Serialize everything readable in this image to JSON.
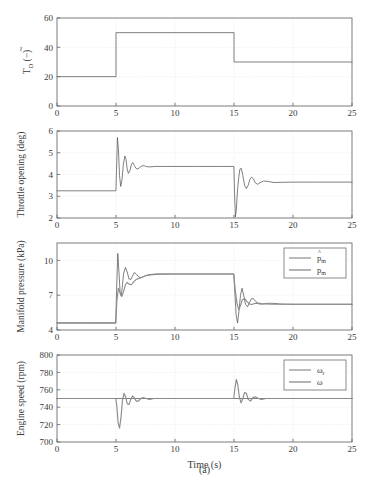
{
  "figure": {
    "caption": "(a)",
    "xlabel": "Time (s)",
    "line_color_estimate": "#555555",
    "line_color_actual": "#8c8c8c",
    "axis_color": "#6e6e6e",
    "grid_color": "#dcdcdc"
  },
  "chart_data": [
    {
      "type": "line",
      "title": "",
      "ylabel": "T̃_D (−)",
      "ylabel_parts": {
        "base": "T",
        "accent": "~",
        "sub": "D",
        "unit": "(−)"
      },
      "xlabel": "",
      "xlim": [
        0,
        25
      ],
      "ylim": [
        0,
        60
      ],
      "xticks": [
        0,
        5,
        10,
        15,
        20,
        25
      ],
      "yticks": [
        0,
        20,
        40,
        60
      ],
      "grid": true,
      "legend": null,
      "series": [
        {
          "name": "T_D",
          "style": "solid",
          "x": [
            0,
            5,
            5,
            15,
            15,
            25
          ],
          "values": [
            20,
            20,
            50,
            50,
            30,
            30
          ]
        }
      ],
      "annotations": [
        "step up from 20 to 50 at t=5 s",
        "step down from 50 to 30 at t=15 s"
      ]
    },
    {
      "type": "line",
      "title": "",
      "ylabel": "Throttle opening (deg)",
      "xlabel": "",
      "xlim": [
        0,
        25
      ],
      "ylim": [
        2,
        6
      ],
      "xticks": [
        0,
        5,
        10,
        15,
        20,
        25
      ],
      "yticks": [
        2,
        3,
        4,
        5,
        6
      ],
      "grid": true,
      "legend": null,
      "series": [
        {
          "name": "throttle",
          "style": "solid",
          "x": [
            0,
            1,
            2,
            3,
            4,
            4.99,
            5.05,
            5.12,
            5.2,
            5.3,
            5.4,
            5.5,
            5.62,
            5.75,
            5.85,
            5.95,
            6.05,
            6.18,
            6.3,
            6.42,
            6.55,
            6.7,
            6.85,
            7.0,
            7.2,
            7.4,
            7.6,
            7.9,
            8.3,
            9,
            10,
            12,
            14,
            14.99,
            15.05,
            15.12,
            15.2,
            15.3,
            15.4,
            15.5,
            15.62,
            15.75,
            15.9,
            16.05,
            16.2,
            16.35,
            16.5,
            16.65,
            16.8,
            17.0,
            17.2,
            17.5,
            17.9,
            18.4,
            19,
            20,
            22,
            25
          ],
          "values": [
            3.25,
            3.25,
            3.25,
            3.25,
            3.25,
            3.25,
            4.3,
            5.7,
            5.2,
            3.95,
            3.45,
            3.72,
            4.45,
            4.85,
            4.7,
            4.25,
            4.05,
            4.18,
            4.45,
            4.55,
            4.42,
            4.28,
            4.25,
            4.32,
            4.4,
            4.4,
            4.36,
            4.35,
            4.37,
            4.37,
            4.37,
            4.37,
            4.37,
            4.37,
            3.1,
            2.05,
            2.4,
            3.3,
            3.85,
            4.25,
            4.28,
            3.95,
            3.5,
            3.35,
            3.5,
            3.78,
            3.88,
            3.8,
            3.62,
            3.55,
            3.62,
            3.7,
            3.68,
            3.63,
            3.64,
            3.65,
            3.65,
            3.65
          ]
        }
      ],
      "annotations": [
        "baseline 3.25 deg",
        "overshoot to 5.7 deg at t=5 s",
        "settles near 4.37 deg",
        "undershoot to 2.05 deg at t=15 s",
        "settles near 3.65 deg"
      ]
    },
    {
      "type": "line",
      "title": "",
      "ylabel": "Manifold pressure (kPa)",
      "xlabel": "",
      "xlim": [
        0,
        25
      ],
      "ylim": [
        4,
        11.5
      ],
      "xticks": [
        0,
        5,
        10,
        15,
        20,
        25
      ],
      "yticks": [
        4,
        7,
        10
      ],
      "grid": true,
      "legend": {
        "position": "top-right",
        "entries": [
          "p̂_m",
          "p_m"
        ]
      },
      "series": [
        {
          "name": "p_hat_m",
          "label_parts": {
            "base": "p",
            "accent": "^",
            "sub": "m"
          },
          "style": "solid",
          "x": [
            0,
            1,
            2,
            3,
            4,
            4.98,
            5.05,
            5.15,
            5.25,
            5.35,
            5.45,
            5.55,
            5.65,
            5.8,
            5.95,
            6.1,
            6.25,
            6.4,
            6.55,
            6.7,
            6.9,
            7.1,
            7.35,
            7.6,
            7.9,
            8.3,
            8.8,
            9.5,
            10.5,
            12,
            14,
            14.98,
            15.08,
            15.18,
            15.3,
            15.42,
            15.55,
            15.68,
            15.82,
            15.98,
            16.15,
            16.3,
            16.48,
            16.65,
            16.85,
            17.1,
            17.4,
            17.8,
            18.3,
            19,
            20,
            22,
            25
          ],
          "values": [
            4.6,
            4.6,
            4.6,
            4.6,
            4.6,
            4.6,
            7.4,
            10.6,
            9.0,
            7.2,
            6.9,
            7.9,
            8.9,
            9.4,
            9.0,
            8.4,
            8.35,
            8.65,
            8.95,
            8.85,
            8.6,
            8.5,
            8.6,
            8.72,
            8.78,
            8.82,
            8.83,
            8.83,
            8.83,
            8.83,
            8.83,
            8.83,
            7.1,
            5.3,
            4.6,
            5.6,
            7.0,
            7.6,
            7.0,
            6.2,
            6.0,
            6.35,
            6.7,
            6.7,
            6.45,
            6.25,
            6.22,
            6.3,
            6.3,
            6.24,
            6.22,
            6.22,
            6.22
          ]
        },
        {
          "name": "p_m",
          "label_parts": {
            "base": "p",
            "accent": "",
            "sub": "m"
          },
          "style": "solid",
          "x": [
            0,
            1,
            2,
            3,
            4,
            4.98,
            5.08,
            5.2,
            5.35,
            5.5,
            5.65,
            5.8,
            5.95,
            6.1,
            6.3,
            6.5,
            6.7,
            6.95,
            7.2,
            7.5,
            7.9,
            8.4,
            9,
            10,
            11,
            12,
            14,
            14.98,
            15.1,
            15.25,
            15.4,
            15.55,
            15.7,
            15.9,
            16.1,
            16.3,
            16.5,
            16.75,
            17.0,
            17.3,
            17.7,
            18.2,
            19,
            20,
            22,
            25
          ],
          "values": [
            4.62,
            4.62,
            4.62,
            4.62,
            4.62,
            4.62,
            6.6,
            7.6,
            7.2,
            6.9,
            7.35,
            7.9,
            8.1,
            7.95,
            7.9,
            8.15,
            8.35,
            8.45,
            8.55,
            8.68,
            8.75,
            8.8,
            8.82,
            8.83,
            8.83,
            8.83,
            8.83,
            8.83,
            7.5,
            6.3,
            5.75,
            6.1,
            6.6,
            6.7,
            6.45,
            6.25,
            6.2,
            6.28,
            6.32,
            6.28,
            6.24,
            6.22,
            6.22,
            6.22,
            6.22,
            6.22
          ]
        }
      ],
      "annotations": [
        "baseline 4.6 kPa",
        "estimate overshoots to 10.6 kPa at t=5 s",
        "settles near 8.83 kPa",
        "drops to 4.6 kPa at t=15 s",
        "settles near 6.2 kPa"
      ]
    },
    {
      "type": "line",
      "title": "",
      "ylabel": "Engine speed (rpm)",
      "xlabel": "Time (s)",
      "xlim": [
        0,
        25
      ],
      "ylim": [
        700,
        800
      ],
      "xticks": [
        0,
        5,
        10,
        15,
        20,
        25
      ],
      "yticks": [
        700,
        720,
        740,
        760,
        780,
        800
      ],
      "grid": true,
      "legend": {
        "position": "top-right",
        "entries": [
          "ω_r",
          "ω"
        ]
      },
      "series": [
        {
          "name": "omega_r",
          "label_parts": {
            "base": "ω",
            "accent": "",
            "sub": "r"
          },
          "style": "solid",
          "x": [
            0,
            25
          ],
          "values": [
            750,
            750
          ]
        },
        {
          "name": "omega",
          "label_parts": {
            "base": "ω",
            "accent": "",
            "sub": ""
          },
          "style": "solid",
          "x": [
            0,
            1,
            2,
            3,
            4,
            4.98,
            5.08,
            5.18,
            5.3,
            5.42,
            5.55,
            5.68,
            5.82,
            5.95,
            6.1,
            6.25,
            6.4,
            6.55,
            6.72,
            6.9,
            7.1,
            7.3,
            7.55,
            7.85,
            8.2,
            8.7,
            9.3,
            10,
            11,
            12.5,
            14,
            14.98,
            15.08,
            15.2,
            15.32,
            15.45,
            15.6,
            15.75,
            15.9,
            16.05,
            16.2,
            16.4,
            16.6,
            16.8,
            17.05,
            17.35,
            17.7,
            18.2,
            19,
            20,
            22,
            25
          ],
          "values": [
            750,
            750,
            750,
            750,
            750,
            750,
            740,
            722,
            716,
            728,
            748,
            756,
            752,
            744,
            743,
            749,
            753,
            751,
            747,
            747,
            750,
            751,
            750,
            749,
            750,
            750,
            750,
            750,
            750,
            750,
            750,
            750,
            762,
            772,
            766,
            752,
            745,
            750,
            757,
            756,
            749,
            747,
            751,
            752,
            750,
            749,
            750,
            750,
            750,
            750,
            750,
            750
          ]
        }
      ],
      "annotations": [
        "reference constant at 750 rpm",
        "dip to 716 rpm at t=5 s",
        "peak to 772 rpm at t=15 s"
      ]
    }
  ]
}
